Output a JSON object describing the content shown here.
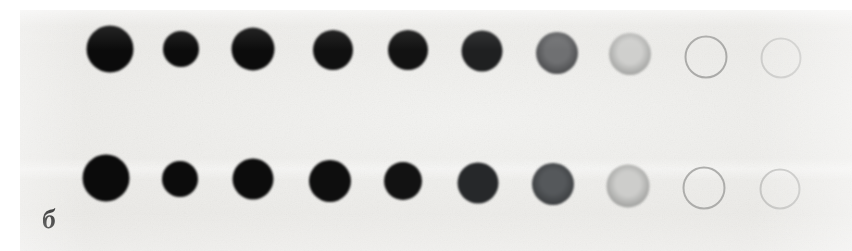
{
  "figure": {
    "panel_label": "б",
    "background_color": "#ebeae7",
    "paper_margin_color": "#ffffff",
    "width": 852,
    "height": 251
  },
  "chart_data": {
    "type": "scatter",
    "xlabel": "",
    "ylabel": "",
    "series": [
      {
        "name": "row-a-top",
        "row_index": 0,
        "center_y": 49,
        "spots": [
          {
            "index": 1,
            "cx": 110,
            "cy": 49,
            "diameter": 47,
            "fill": "#0b0b0b",
            "rim": "#0b0b0b",
            "density": 1.0,
            "hollow": false
          },
          {
            "index": 2,
            "cx": 181,
            "cy": 49,
            "diameter": 36,
            "fill": "#0c0c0c",
            "rim": "#0c0c0c",
            "density": 1.0,
            "hollow": false
          },
          {
            "index": 3,
            "cx": 253,
            "cy": 49,
            "diameter": 43,
            "fill": "#0c0c0c",
            "rim": "#0c0c0c",
            "density": 0.99,
            "hollow": false
          },
          {
            "index": 4,
            "cx": 333,
            "cy": 50,
            "diameter": 40,
            "fill": "#101010",
            "rim": "#101010",
            "density": 0.97,
            "hollow": false
          },
          {
            "index": 5,
            "cx": 408,
            "cy": 50,
            "diameter": 40,
            "fill": "#121212",
            "rim": "#121212",
            "density": 0.95,
            "hollow": false
          },
          {
            "index": 6,
            "cx": 482,
            "cy": 51,
            "diameter": 41,
            "fill": "#1f2021",
            "rim": "#141414",
            "density": 0.88,
            "hollow": false
          },
          {
            "index": 7,
            "cx": 557,
            "cy": 53,
            "diameter": 42,
            "fill": "#6f7072",
            "rim": "#3a3b3d",
            "density": 0.58,
            "hollow": false
          },
          {
            "index": 8,
            "cx": 630,
            "cy": 54,
            "diameter": 42,
            "fill": "#cfcfcd",
            "rim": "#8d8e8c",
            "density": 0.22,
            "hollow": false
          },
          {
            "index": 9,
            "cx": 706,
            "cy": 57,
            "diameter": 43,
            "fill": "transparent",
            "rim": "#9a9a98",
            "density": 0.06,
            "hollow": true
          },
          {
            "index": 10,
            "cx": 781,
            "cy": 58,
            "diameter": 41,
            "fill": "transparent",
            "rim": "#bcbcba",
            "density": 0.03,
            "hollow": true
          }
        ]
      },
      {
        "name": "row-b-bottom",
        "row_index": 1,
        "center_y": 178,
        "spots": [
          {
            "index": 1,
            "cx": 106,
            "cy": 178,
            "diameter": 47,
            "fill": "#0b0b0b",
            "rim": "#0b0b0b",
            "density": 1.0,
            "hollow": false
          },
          {
            "index": 2,
            "cx": 180,
            "cy": 179,
            "diameter": 36,
            "fill": "#0c0c0c",
            "rim": "#0c0c0c",
            "density": 1.0,
            "hollow": false
          },
          {
            "index": 3,
            "cx": 253,
            "cy": 179,
            "diameter": 41,
            "fill": "#0c0c0c",
            "rim": "#0c0c0c",
            "density": 0.99,
            "hollow": false
          },
          {
            "index": 4,
            "cx": 330,
            "cy": 181,
            "diameter": 42,
            "fill": "#0e0e0e",
            "rim": "#0e0e0e",
            "density": 0.98,
            "hollow": false
          },
          {
            "index": 5,
            "cx": 403,
            "cy": 181,
            "diameter": 38,
            "fill": "#121212",
            "rim": "#121212",
            "density": 0.95,
            "hollow": false
          },
          {
            "index": 6,
            "cx": 478,
            "cy": 183,
            "diameter": 41,
            "fill": "#26282a",
            "rim": "#151515",
            "density": 0.85,
            "hollow": false
          },
          {
            "index": 7,
            "cx": 553,
            "cy": 184,
            "diameter": 42,
            "fill": "#55585b",
            "rim": "#2d2f31",
            "density": 0.68,
            "hollow": false
          },
          {
            "index": 8,
            "cx": 628,
            "cy": 186,
            "diameter": 43,
            "fill": "#cdcdcb",
            "rim": "#8a8b89",
            "density": 0.23,
            "hollow": false
          },
          {
            "index": 9,
            "cx": 704,
            "cy": 188,
            "diameter": 43,
            "fill": "transparent",
            "rim": "#9d9d9b",
            "density": 0.06,
            "hollow": true
          },
          {
            "index": 10,
            "cx": 780,
            "cy": 189,
            "diameter": 41,
            "fill": "transparent",
            "rim": "#b5b5b3",
            "density": 0.04,
            "hollow": true
          }
        ]
      }
    ]
  }
}
